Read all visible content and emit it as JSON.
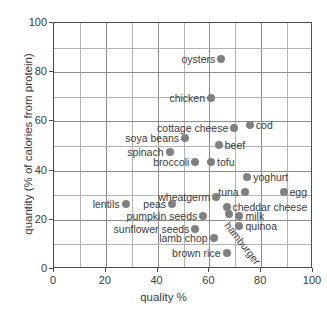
{
  "chart_data": {
    "type": "scatter",
    "title": "",
    "xlabel": "quality %",
    "ylabel": "quantity (% of calories from protein)",
    "xlim": [
      0,
      100
    ],
    "ylim": [
      0,
      100
    ],
    "xticks": [
      0,
      20,
      40,
      60,
      80,
      100
    ],
    "yticks": [
      0,
      20,
      40,
      60,
      80,
      100
    ],
    "xtick_labels": [
      "0",
      "20",
      "40",
      "60",
      "80",
      "100"
    ],
    "ytick_labels": [
      "0",
      "20",
      "40",
      "60",
      "80",
      "100"
    ],
    "grid": true,
    "grid_minor_step": 10,
    "legend": "none",
    "marker_color": "#808080",
    "points": [
      {
        "label": "oysters",
        "x": 65,
        "y": 85,
        "label_pos": "left"
      },
      {
        "label": "chicken",
        "x": 61,
        "y": 69,
        "label_pos": "left"
      },
      {
        "label": "cottage cheese",
        "x": 70,
        "y": 57,
        "label_pos": "left"
      },
      {
        "label": "cod",
        "x": 76,
        "y": 58,
        "label_pos": "right"
      },
      {
        "label": "soya beans",
        "x": 51,
        "y": 53,
        "label_pos": "left"
      },
      {
        "label": "beef",
        "x": 64,
        "y": 50,
        "label_pos": "right"
      },
      {
        "label": "spinach",
        "x": 45,
        "y": 47,
        "label_pos": "left"
      },
      {
        "label": "broccoli",
        "x": 55,
        "y": 43,
        "label_pos": "left"
      },
      {
        "label": "tofu",
        "x": 61,
        "y": 43,
        "label_pos": "right"
      },
      {
        "label": "yoghurt",
        "x": 75,
        "y": 37,
        "label_pos": "right"
      },
      {
        "label": "egg",
        "x": 89,
        "y": 31,
        "label_pos": "right"
      },
      {
        "label": "tuna",
        "x": 74,
        "y": 31,
        "label_pos": "left"
      },
      {
        "label": "wheatgerm",
        "x": 63,
        "y": 29,
        "label_pos": "left"
      },
      {
        "label": "cheddar cheese",
        "x": 67,
        "y": 25,
        "label_pos": "right"
      },
      {
        "label": "lentils",
        "x": 28,
        "y": 26,
        "label_pos": "left"
      },
      {
        "label": "peas",
        "x": 46,
        "y": 26,
        "label_pos": "left"
      },
      {
        "label": "pumpkin seeds",
        "x": 58,
        "y": 21,
        "label_pos": "left"
      },
      {
        "label": "milk",
        "x": 72,
        "y": 21,
        "label_pos": "right"
      },
      {
        "label": "sunflower seeds",
        "x": 55,
        "y": 16,
        "label_pos": "left"
      },
      {
        "label": "quinoa",
        "x": 72,
        "y": 17,
        "label_pos": "right"
      },
      {
        "label": "lamb chop",
        "x": 62,
        "y": 12,
        "label_pos": "left"
      },
      {
        "label": "brown rice",
        "x": 67,
        "y": 6,
        "label_pos": "left"
      },
      {
        "label": "hamburger",
        "x": 68,
        "y": 22,
        "label_pos": "rot",
        "label_angle": -52
      }
    ]
  }
}
